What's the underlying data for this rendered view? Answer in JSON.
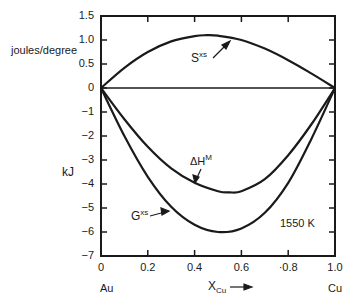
{
  "chart_data": {
    "type": "line",
    "title": "",
    "annotation": "1550 K",
    "xlabel": "X_Cu",
    "xlabel_main": "X",
    "xlabel_sub": "Cu",
    "x_end_labels": {
      "left": "Au",
      "right": "Cu"
    },
    "ylabel_upper": "joules/degree",
    "ylabel_lower": "kJ",
    "xlim": [
      0,
      1.0
    ],
    "ylim": [
      -7,
      1.5
    ],
    "x_ticks": [
      "0",
      "0.2",
      "0.4",
      "0.6",
      "·0.8",
      "1.0"
    ],
    "y_ticks": [
      "1.5",
      "1.0",
      "0.5",
      "0",
      "−1",
      "−2",
      "−3",
      "−4",
      "−5",
      "−6",
      "−7"
    ],
    "grid": false,
    "series": [
      {
        "name": "S^xs",
        "units": "joules/degree",
        "x": [
          0,
          0.1,
          0.2,
          0.3,
          0.4,
          0.45,
          0.5,
          0.6,
          0.7,
          0.8,
          0.9,
          1.0
        ],
        "values": [
          0,
          0.42,
          0.75,
          0.97,
          1.08,
          1.1,
          1.09,
          1.0,
          0.82,
          0.58,
          0.3,
          0
        ]
      },
      {
        "name": "ΔH^M",
        "units": "kJ",
        "x": [
          0,
          0.1,
          0.2,
          0.3,
          0.4,
          0.5,
          0.55,
          0.6,
          0.7,
          0.8,
          0.9,
          1.0
        ],
        "values": [
          0,
          -1.3,
          -2.45,
          -3.35,
          -3.95,
          -4.3,
          -4.35,
          -4.3,
          -3.8,
          -2.8,
          -1.5,
          0
        ]
      },
      {
        "name": "G^xs",
        "units": "kJ",
        "x": [
          0,
          0.1,
          0.2,
          0.3,
          0.4,
          0.5,
          0.6,
          0.7,
          0.8,
          0.9,
          1.0
        ],
        "values": [
          0,
          -2.0,
          -3.7,
          -4.95,
          -5.7,
          -6.0,
          -5.85,
          -5.2,
          -3.95,
          -2.1,
          0
        ]
      }
    ],
    "curve_labels": [
      {
        "main": "S",
        "sup": "xs"
      },
      {
        "main": "ΔH",
        "sup": "M"
      },
      {
        "main": "G",
        "sup": "xs"
      }
    ]
  }
}
